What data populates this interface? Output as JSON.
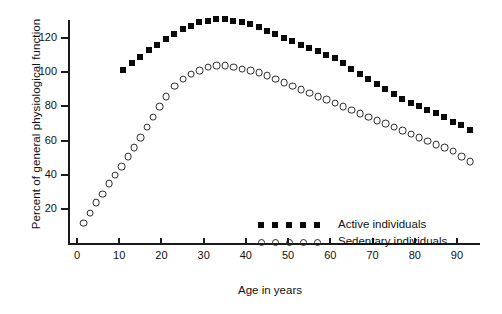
{
  "chart_data": {
    "type": "scatter",
    "title": "",
    "xlabel": "Age in years",
    "ylabel": "Percent of general physiological function",
    "xlim": [
      0,
      95
    ],
    "ylim": [
      0,
      137
    ],
    "grid": false,
    "legend_position": "inside-bottom-right",
    "xticks": [
      0,
      10,
      20,
      30,
      40,
      50,
      60,
      70,
      80,
      90
    ],
    "yticks": [
      20,
      40,
      60,
      80,
      100,
      120
    ],
    "series": [
      {
        "name": "Active individuals",
        "marker": "filled-square",
        "color": "#0a0a0a",
        "x": [
          11,
          13,
          15,
          17,
          19,
          21,
          23,
          25,
          27,
          29,
          31,
          33,
          35,
          37,
          39,
          41,
          43,
          45,
          47,
          49,
          51,
          53,
          55,
          57,
          59,
          61,
          63,
          65,
          67,
          69,
          71,
          73,
          75,
          77,
          79,
          81,
          83,
          85,
          87,
          89,
          91,
          93
        ],
        "y": [
          101,
          105,
          109,
          113,
          116,
          119,
          122,
          125,
          127,
          129,
          130,
          131,
          131,
          130,
          129,
          128,
          126,
          124,
          122,
          120,
          118,
          116,
          114,
          112,
          110,
          108,
          105,
          102,
          99,
          96,
          93,
          90,
          87,
          84,
          82,
          80,
          78,
          76,
          74,
          71,
          69,
          66
        ]
      },
      {
        "name": "Sedentary individuals",
        "marker": "open-circle",
        "color": "#2b2b2b",
        "x": [
          1.5,
          3,
          4.5,
          6,
          7.5,
          9,
          10.5,
          12,
          13.5,
          15,
          16.5,
          18,
          19.5,
          21,
          23,
          25,
          27,
          29,
          31,
          33,
          35,
          37,
          39,
          41,
          43,
          45,
          47,
          49,
          51,
          53,
          55,
          57,
          59,
          61,
          63,
          65,
          67,
          69,
          71,
          73,
          75,
          77,
          79,
          81,
          83,
          85,
          87,
          89,
          91,
          93
        ],
        "y": [
          12,
          18,
          24,
          29,
          35,
          40,
          45,
          51,
          56,
          62,
          68,
          74,
          80,
          86,
          92,
          96,
          99,
          101,
          103,
          104,
          104,
          103,
          102,
          101,
          100,
          98,
          96,
          94,
          92,
          90,
          88,
          86,
          84,
          82,
          80,
          78,
          76,
          74,
          72,
          70,
          68,
          66,
          64,
          62,
          60,
          58,
          56,
          54,
          51,
          48
        ]
      }
    ]
  },
  "legend": {
    "items": [
      {
        "label": "Active individuals",
        "marker": "filled-square"
      },
      {
        "label": "Sedentary individuals",
        "marker": "open-circle"
      }
    ]
  }
}
